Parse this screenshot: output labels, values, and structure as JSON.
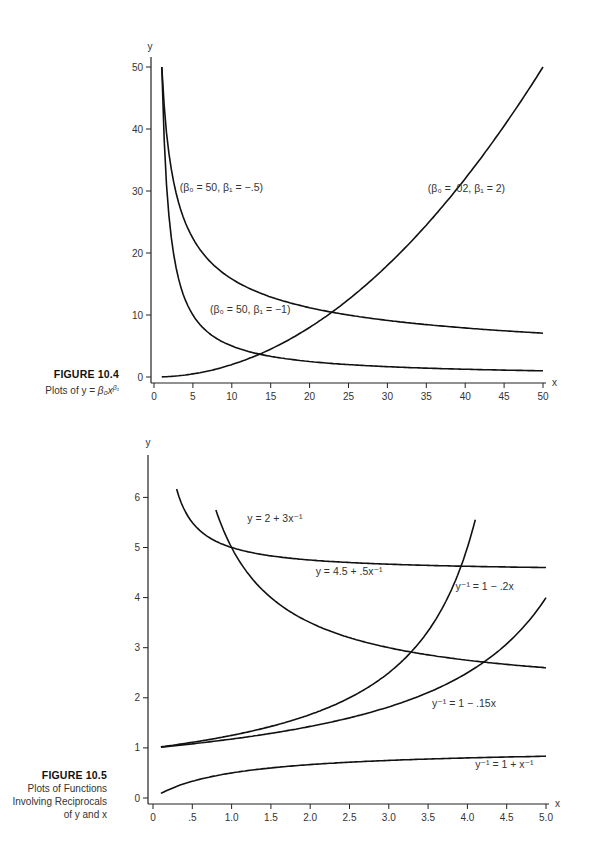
{
  "figures": [
    {
      "number_label": "FIGURE 10.4",
      "caption": "Plots of y = β₀x^β₁",
      "caption_text": "Plots of y = ",
      "caption_math": "β₀x",
      "caption_sup": "β₁"
    },
    {
      "number_label": "FIGURE 10.5",
      "caption_lines": [
        "Plots of Functions",
        "Involving Reciprocals",
        "of y and x"
      ]
    }
  ],
  "chart_data": [
    {
      "type": "line",
      "title": "FIGURE 10.4 Plots of y = β₀x^β₁",
      "xlabel": "x",
      "ylabel": "y",
      "xlim": [
        0,
        50
      ],
      "ylim": [
        0,
        50
      ],
      "xticks": [
        0,
        5,
        10,
        15,
        20,
        25,
        30,
        35,
        40,
        45,
        50
      ],
      "xtick_labels": [
        "0",
        "5",
        "10",
        "15",
        "20",
        "25",
        "30",
        "35",
        "40",
        "45",
        "50"
      ],
      "yticks": [
        0,
        10,
        20,
        30,
        40,
        50
      ],
      "ytick_labels": [
        "0",
        "10",
        "20",
        "30",
        "40",
        "50"
      ],
      "grid": false,
      "legend": "none (inline curve labels)",
      "series": [
        {
          "name": "(β₀ = 50, β₁ = −.5)",
          "formula": "y = 50 x^-0.5",
          "x": [
            1,
            2,
            3,
            5,
            7,
            10,
            15,
            20,
            25,
            30,
            35,
            40,
            45,
            50
          ],
          "values": [
            50,
            35.36,
            28.87,
            22.36,
            18.9,
            15.81,
            12.91,
            11.18,
            10,
            9.13,
            8.45,
            7.91,
            7.45,
            7.07
          ]
        },
        {
          "name": "(β₀ = 50, β₁ = −1)",
          "formula": "y = 50 x^-1",
          "x": [
            1,
            2,
            3,
            5,
            7,
            10,
            15,
            20,
            25,
            30,
            35,
            40,
            45,
            50
          ],
          "values": [
            50,
            25,
            16.67,
            10,
            7.14,
            5,
            3.33,
            2.5,
            2,
            1.67,
            1.43,
            1.25,
            1.11,
            1
          ]
        },
        {
          "name": "(β₀ = .02, β₁ = 2)",
          "formula": "y = 0.02 x^2",
          "x": [
            1,
            5,
            10,
            15,
            20,
            25,
            30,
            35,
            40,
            45,
            50
          ],
          "values": [
            0.02,
            0.5,
            2,
            4.5,
            8,
            12.5,
            18,
            24.5,
            32,
            40.5,
            50
          ]
        }
      ],
      "labels": [
        {
          "text": "(β₀ = 50, β₁ = −.5)",
          "x": 3.3,
          "y": 30
        },
        {
          "text": "(β₀ = 50, β₁ = −1)",
          "x": 7.2,
          "y": 10.3
        },
        {
          "text": "(β₀ = .02, β₁ = 2)",
          "x": 35.2,
          "y": 29.8
        }
      ]
    },
    {
      "type": "line",
      "title": "FIGURE 10.5 Plots of Functions Involving Reciprocals of y and x",
      "xlabel": "x",
      "ylabel": "y",
      "xlim": [
        0,
        5.0
      ],
      "ylim": [
        0,
        6.8
      ],
      "xticks": [
        0,
        0.5,
        1.0,
        1.5,
        2.0,
        2.5,
        3.0,
        3.5,
        4.0,
        4.5,
        5.0
      ],
      "xtick_labels": [
        "0",
        ".5",
        "1.0",
        "1.5",
        "2.0",
        "2.5",
        "3.0",
        "3.5",
        "4.0",
        "4.5",
        "5.0"
      ],
      "yticks": [
        0,
        1,
        2,
        3,
        4,
        5,
        6
      ],
      "ytick_labels": [
        "0",
        "1",
        "2",
        "3",
        "4",
        "5",
        "6"
      ],
      "grid": false,
      "legend": "none (inline curve labels)",
      "series": [
        {
          "name": "y = 2 + 3x⁻¹",
          "formula": "y = 2 + 3/x",
          "x": [
            0.8,
            1.0,
            1.5,
            2.0,
            2.5,
            3.0,
            3.5,
            4.0,
            4.5,
            5.0
          ],
          "values": [
            5.75,
            5.0,
            4.0,
            3.5,
            3.2,
            3.0,
            2.86,
            2.75,
            2.67,
            2.6
          ]
        },
        {
          "name": "y = 4.5 + .5x⁻¹",
          "formula": "y = 4.5 + 0.5/x",
          "x": [
            0.3,
            0.5,
            1.0,
            1.5,
            2.0,
            2.5,
            3.0,
            3.5,
            4.0,
            4.5,
            5.0
          ],
          "values": [
            6.17,
            5.5,
            5.0,
            4.83,
            4.75,
            4.7,
            4.67,
            4.64,
            4.63,
            4.61,
            4.6
          ]
        },
        {
          "name": "y⁻¹ = 1 − .2x",
          "formula": "y = 1/(1 - 0.2x)",
          "x": [
            0.1,
            0.5,
            1.0,
            1.5,
            2.0,
            2.5,
            3.0,
            3.5,
            4.0,
            4.1
          ],
          "values": [
            1.02,
            1.11,
            1.25,
            1.43,
            1.67,
            2.0,
            2.5,
            3.33,
            5.0,
            5.56
          ]
        },
        {
          "name": "y⁻¹ = 1 − .15x",
          "formula": "y = 1/(1 - 0.15x)",
          "x": [
            0.1,
            0.5,
            1.0,
            1.5,
            2.0,
            2.5,
            3.0,
            3.5,
            4.0,
            4.5,
            5.0
          ],
          "values": [
            1.02,
            1.08,
            1.18,
            1.29,
            1.43,
            1.6,
            1.82,
            2.11,
            2.5,
            3.08,
            4.0
          ]
        },
        {
          "name": "y⁻¹ = 1 + x⁻¹",
          "formula": "y = x/(x + 1)",
          "x": [
            0.1,
            0.5,
            1.0,
            1.5,
            2.0,
            2.5,
            3.0,
            3.5,
            4.0,
            4.5,
            5.0
          ],
          "values": [
            0.09,
            0.33,
            0.5,
            0.6,
            0.67,
            0.71,
            0.75,
            0.78,
            0.8,
            0.82,
            0.83
          ]
        }
      ],
      "labels": [
        {
          "text": "y = 2 + 3x⁻¹",
          "x": 1.2,
          "y": 5.5
        },
        {
          "text": "y = 4.5 + .5x⁻¹",
          "x": 2.07,
          "y": 4.45
        },
        {
          "text": "y⁻¹ = 1 − .2x",
          "x": 3.85,
          "y": 4.15
        },
        {
          "text": "y⁻¹ = 1 − .15x",
          "x": 3.55,
          "y": 1.82
        },
        {
          "text": "y⁻¹ = 1 + x⁻¹",
          "x": 4.1,
          "y": 0.6
        }
      ]
    }
  ]
}
